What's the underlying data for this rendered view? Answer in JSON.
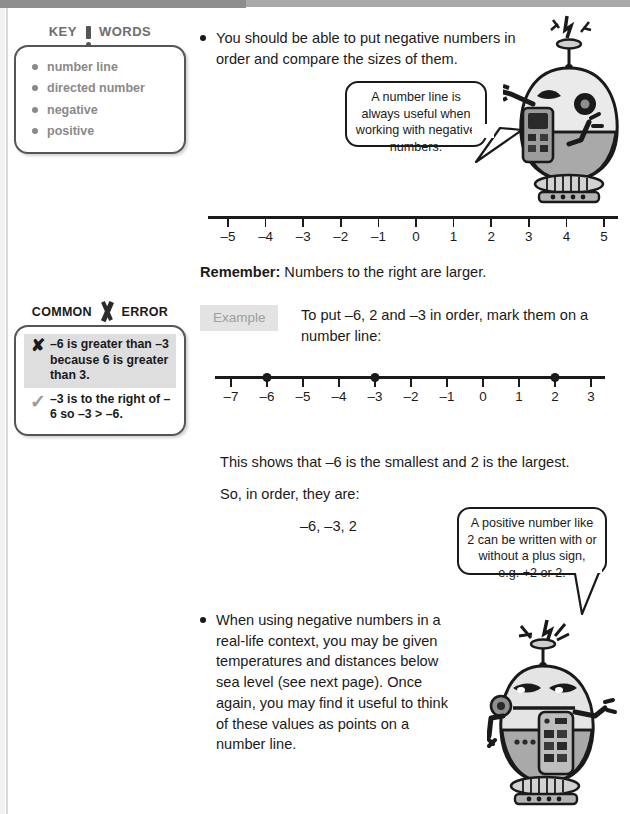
{
  "keywords": {
    "heading_left": "KEY",
    "heading_right": "WORDS",
    "items": [
      {
        "label": "number line"
      },
      {
        "label": "directed number"
      },
      {
        "label": "negative"
      },
      {
        "label": "positive"
      }
    ]
  },
  "common_error": {
    "heading_left": "COMMON",
    "heading_right": "ERROR",
    "cross_mark": "✘",
    "tick_mark": "✓",
    "cross_text": "–6 is greater than –3 because 6 is greater than 3.",
    "tick_text": "–3 is to the right of –6 so –3 > –6."
  },
  "bullets": [
    {
      "text": "You should be able to put negative numbers in order and compare the sizes of them."
    },
    {
      "text": "When using negative numbers in a real-life context, you may be given temperatures and distances below sea level (see next page). Once again, you may find it useful to think of these values as points on a number line."
    }
  ],
  "bubbles": [
    {
      "text": "A number line is always useful when working with negative numbers."
    },
    {
      "text": "A positive number like 2 can be written with or without a plus sign, e.g. +2 or 2."
    }
  ],
  "remember": {
    "label": "Remember:",
    "text": " Numbers to the right are larger."
  },
  "example": {
    "badge": "Example",
    "text": "To put –6, 2 and –3 in order, mark them on a number line:"
  },
  "conclusion": {
    "shows": "This shows that –6 is the smallest and 2 is the largest.",
    "order_label": "So, in order, they are:",
    "answer": "–6, –3, 2"
  },
  "chart_data": [
    {
      "type": "numberline",
      "name": "numberline-top",
      "ticks": [
        -5,
        -4,
        -3,
        -2,
        -1,
        0,
        1,
        2,
        3,
        4,
        5
      ],
      "tick_labels": [
        "–5",
        "–4",
        "–3",
        "–2",
        "–1",
        "0",
        "1",
        "2",
        "3",
        "4",
        "5"
      ],
      "points": [],
      "xlim": [
        -5.6,
        5.6
      ],
      "grid": false
    },
    {
      "type": "numberline",
      "name": "numberline-example",
      "ticks": [
        -7,
        -6,
        -5,
        -4,
        -3,
        -2,
        -1,
        0,
        1,
        2,
        3
      ],
      "tick_labels": [
        "–7",
        "–6",
        "–5",
        "–4",
        "–3",
        "–2",
        "–1",
        "0",
        "1",
        "2",
        "3"
      ],
      "points": [
        -6,
        -3,
        2
      ],
      "xlim": [
        -7.6,
        3.6
      ],
      "grid": false
    }
  ],
  "colors": {
    "ink": "#1a1a1a",
    "keyword_gray": "#8a8a8a",
    "badge_bg": "#e3e3e3",
    "badge_text": "#9d9d9d",
    "highlight_bg": "#dedede",
    "robot_body_light": "#e8e8e8",
    "robot_body_dark": "#a8a8a8"
  },
  "icons": {
    "robot_top": "robot-character-icon",
    "robot_bottom": "robot-character-icon"
  }
}
